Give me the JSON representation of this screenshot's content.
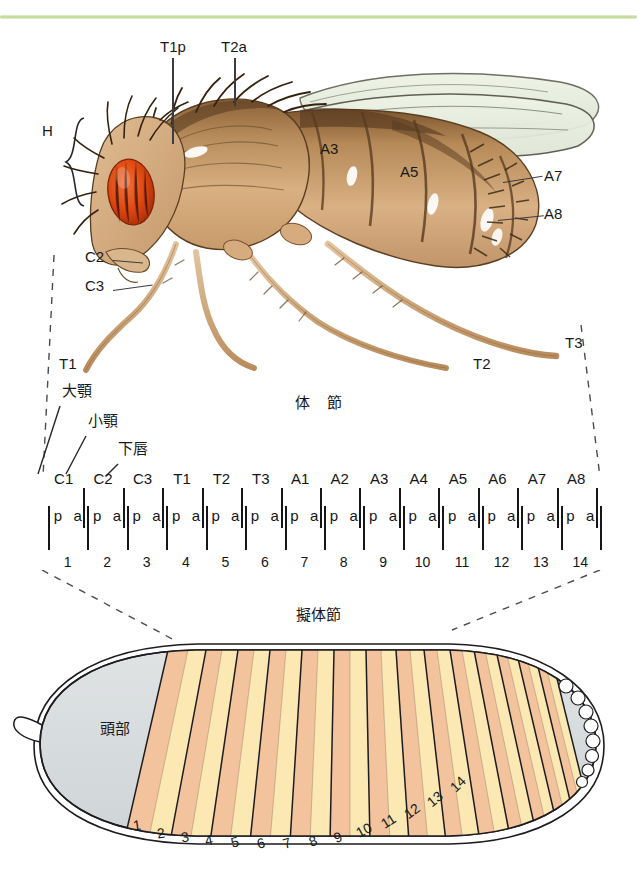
{
  "page": {
    "background_color": "#ffffff",
    "accent_rule_color": "#b9d68d"
  },
  "adult_fly": {
    "caption": "",
    "labels": [
      {
        "id": "head-bracket",
        "text": "H",
        "x": 46,
        "y": 130
      },
      {
        "id": "t1p",
        "text": "T1p",
        "x": 161,
        "y": 44
      },
      {
        "id": "t2a",
        "text": "T2a",
        "x": 222,
        "y": 44
      },
      {
        "id": "a3",
        "text": "A3",
        "x": 321,
        "y": 143
      },
      {
        "id": "a5",
        "text": "A5",
        "x": 401,
        "y": 166
      },
      {
        "id": "a7",
        "text": "A7",
        "x": 543,
        "y": 170
      },
      {
        "id": "a8",
        "text": "A8",
        "x": 543,
        "y": 208
      },
      {
        "id": "c2",
        "text": "C2",
        "x": 86,
        "y": 251
      },
      {
        "id": "c3",
        "text": "C3",
        "x": 86,
        "y": 280
      },
      {
        "id": "t1-leg",
        "text": "T1",
        "x": 60,
        "y": 357
      },
      {
        "id": "t2-leg",
        "text": "T2",
        "x": 474,
        "y": 357
      },
      {
        "id": "t3-leg",
        "text": "T3",
        "x": 566,
        "y": 336
      }
    ],
    "colors": {
      "cuticle_light": "#d9ac7d",
      "cuticle_mid": "#c08d5e",
      "cuticle_dark": "#6b4a2c",
      "eye": "#e04a10",
      "eye_shade": "#b5300a",
      "wing": "#e8eedd",
      "bristle": "#3a2616"
    }
  },
  "segment_diagram": {
    "title": "体　節",
    "appendage_labels": [
      {
        "text": "大顎",
        "x": 62,
        "y": 391
      },
      {
        "text": "小顎",
        "x": 88,
        "y": 421
      },
      {
        "text": "下唇",
        "x": 118,
        "y": 449
      }
    ],
    "segments": [
      "C1",
      "C2",
      "C3",
      "T1",
      "T2",
      "T3",
      "A1",
      "A2",
      "A3",
      "A4",
      "A5",
      "A6",
      "A7",
      "A8"
    ],
    "compartments": [
      "p",
      "a"
    ],
    "parasegment_numbers": [
      1,
      2,
      3,
      4,
      5,
      6,
      7,
      8,
      9,
      10,
      11,
      12,
      13,
      14
    ],
    "ladder_left_px": 48,
    "ladder_right_px": 600
  },
  "embryo": {
    "title": "擬体節",
    "head_label": "頭部",
    "parasegment_numbers": [
      1,
      2,
      3,
      4,
      5,
      6,
      7,
      8,
      9,
      10,
      11,
      12,
      13,
      14
    ],
    "colors": {
      "yolk": "#d8dcdd",
      "stripe_anterior": "#f3c39d",
      "stripe_posterior": "#fbe8b3",
      "outline": "#1d1d20",
      "pole_cell_fill": "#ffffff"
    }
  }
}
